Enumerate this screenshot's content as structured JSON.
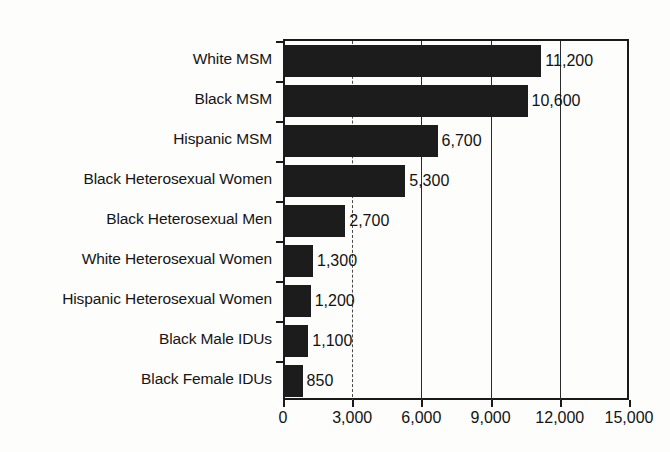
{
  "chart_data": {
    "type": "bar",
    "orientation": "horizontal",
    "title": "",
    "subtitle": "",
    "xlabel": "",
    "ylabel": "",
    "xlim": [
      0,
      15000
    ],
    "grid": true,
    "legend": null,
    "categories": [
      "White MSM",
      "Black MSM",
      "Hispanic MSM",
      "Black Heterosexual Women",
      "Black Heterosexual Men",
      "White Heterosexual Women",
      "Hispanic Heterosexual Women",
      "Black Male IDUs",
      "Black Female IDUs"
    ],
    "values": [
      11200,
      10600,
      6700,
      5300,
      2700,
      1300,
      1200,
      1100,
      850
    ],
    "value_labels": [
      "11,200",
      "10,600",
      "6,700",
      "5,300",
      "2,700",
      "1,300",
      "1,200",
      "1,100",
      "850"
    ],
    "xticks": [
      0,
      3000,
      6000,
      9000,
      12000,
      15000
    ],
    "xtick_labels": [
      "0",
      "3,000",
      "6,000",
      "9,000",
      "12,000",
      "15,000"
    ],
    "bar_color": "#1c1c1c",
    "axis_color": "#1a1a1a",
    "background_color": "#fdfdfb"
  }
}
